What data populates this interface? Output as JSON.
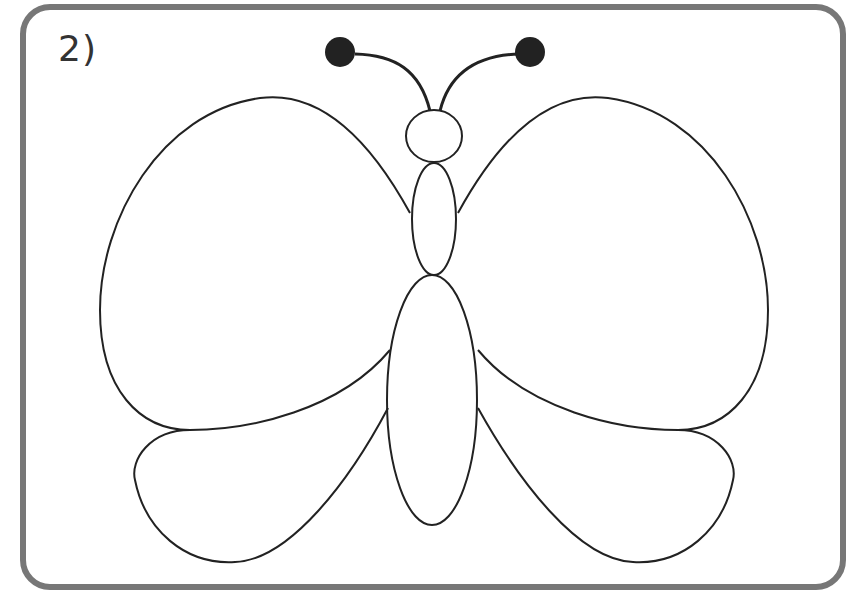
{
  "step_label": "2)",
  "drawing": {
    "subject": "butterfly",
    "stroke_color": "#222222",
    "frame_color": "#777777",
    "antenna_tip_color": "#222222",
    "parts": [
      "antennae",
      "head",
      "thorax",
      "abdomen",
      "upper-left-wing",
      "upper-right-wing",
      "lower-left-wing",
      "lower-right-wing"
    ]
  }
}
